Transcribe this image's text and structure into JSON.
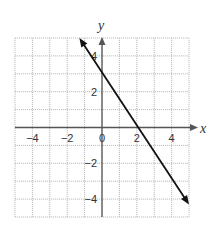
{
  "chart_data": {
    "type": "line",
    "title": "",
    "xlabel": "x",
    "ylabel": "y",
    "xlim": [
      -5,
      5
    ],
    "ylim": [
      -5,
      5
    ],
    "grid": true,
    "x_ticks": [
      -4,
      -2,
      0,
      2,
      4
    ],
    "y_ticks": [
      4,
      2,
      -2,
      -4
    ],
    "x_tick_labels": [
      "−4",
      "−2",
      "0",
      "2",
      "4"
    ],
    "y_tick_labels": [
      "4",
      "2",
      "−2",
      "−4"
    ],
    "series": [
      {
        "name": "line",
        "description": "straight line with arrows at both ends, x-intercept 2, y-intercept about 3.4",
        "points": [
          {
            "x": -1.3,
            "y": 5.0
          },
          {
            "x": 0,
            "y": 3.4
          },
          {
            "x": 2,
            "y": 0
          },
          {
            "x": 5.0,
            "y": -4.3
          }
        ]
      }
    ],
    "colors": {
      "grid": "#bdbdbd",
      "axis": "#555555",
      "line": "#111111"
    }
  }
}
